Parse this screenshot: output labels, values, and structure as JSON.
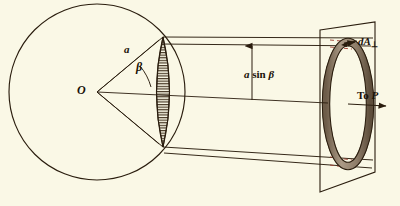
{
  "figure": {
    "background_color": "#faf8e6",
    "ink_color": "#2a1d0e",
    "band_fill_color": "#9c8a75",
    "ring_fill_color": "#a08f7c"
  },
  "labels": {
    "origin": "O",
    "radius": "a",
    "angle": "β",
    "height_prefix": "a",
    "height_fn": "sin",
    "height_angle": "β",
    "height_full": "a sin β",
    "area_element": "dA",
    "area_element_sub": "⊥",
    "area_element_full": "dA⊥",
    "to_point_prefix": "To",
    "to_point": "P",
    "to_point_full": "To P"
  },
  "geometry": {
    "sphere": {
      "cx": 97,
      "cy": 92,
      "r": 88
    },
    "vertex": {
      "x": 97,
      "y": 92
    },
    "cone_upper_contact": {
      "x": 163,
      "y": 37
    },
    "cone_lower_contact": {
      "x": 163,
      "y": 147
    },
    "plane": {
      "top_left": {
        "x": 320,
        "y": 30
      },
      "top_right": {
        "x": 375,
        "y": 22
      },
      "bottom_right": {
        "x": 375,
        "y": 172
      },
      "bottom_left": {
        "x": 320,
        "y": 192
      }
    },
    "ring": {
      "cx": 348,
      "cy": 104,
      "rx": 22,
      "ry": 62,
      "band_thickness": 7
    },
    "axis": {
      "from": {
        "x": 97,
        "y": 92
      },
      "to": {
        "x": 390,
        "y": 104
      }
    },
    "height_arrow": {
      "x": 252,
      "y_top": 47,
      "y_bottom": 100
    }
  }
}
